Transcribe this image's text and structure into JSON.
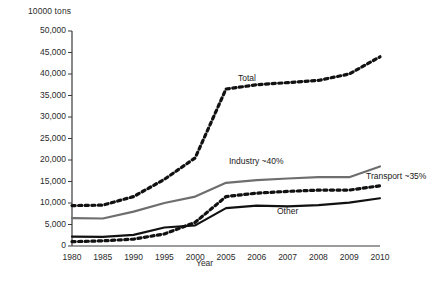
{
  "chart_data": {
    "type": "line",
    "title": "",
    "ylabel": "10000 tons",
    "xlabel": "Year",
    "categories": [
      "1980",
      "1985",
      "1990",
      "1995",
      "2000",
      "2005",
      "2006",
      "2007",
      "2008",
      "2009",
      "2010"
    ],
    "ylim": [
      0,
      50000
    ],
    "ytick_labels": [
      "50,000",
      "45,000",
      "40,000",
      "35,000",
      "30,000",
      "25,000",
      "20,000",
      "15,000",
      "10,000",
      "5,000",
      "0"
    ],
    "ytick_values": [
      50000,
      45000,
      40000,
      35000,
      30000,
      25000,
      20000,
      15000,
      10000,
      5000,
      0
    ],
    "grid": false,
    "legend_position": "inline-annotations",
    "series": [
      {
        "name": "Total",
        "label": "Total",
        "style": "dotted",
        "color": "#111111",
        "values": [
          9400,
          9500,
          11500,
          15500,
          20500,
          36500,
          37500,
          38000,
          38500,
          40000,
          44000
        ]
      },
      {
        "name": "Industry",
        "label": "Industry ~40%",
        "style": "solid",
        "color": "#6e6e6e",
        "values": [
          6500,
          6400,
          8000,
          10000,
          11500,
          14700,
          15300,
          15700,
          16000,
          16000,
          18500
        ]
      },
      {
        "name": "Transport",
        "label": "Transport ~35%",
        "style": "dotted",
        "color": "#111111",
        "values": [
          1000,
          1200,
          1600,
          2800,
          5500,
          11500,
          12300,
          12700,
          13000,
          13000,
          14000
        ]
      },
      {
        "name": "Other",
        "label": "Other",
        "style": "solid",
        "color": "#111111",
        "values": [
          2200,
          2100,
          2600,
          4300,
          4800,
          8800,
          9400,
          9200,
          9500,
          10100,
          11100
        ]
      }
    ],
    "annotations": [
      {
        "text": "Total",
        "x": 238,
        "y": 73
      },
      {
        "text": "Industry ~40%",
        "x": 229,
        "y": 156
      },
      {
        "text": "Transport ~35%",
        "x": 366,
        "y": 171
      },
      {
        "text": "Other",
        "x": 277,
        "y": 206
      }
    ]
  },
  "colors": {
    "axis": "#3a3a3a",
    "total": "#111111",
    "industry": "#6e6e6e",
    "transport": "#111111",
    "other": "#111111",
    "text": "#2b2b2b"
  }
}
